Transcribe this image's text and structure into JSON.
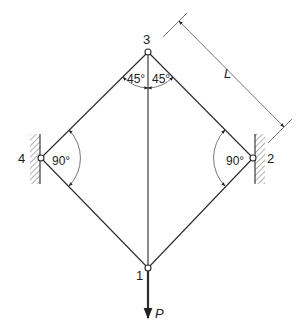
{
  "diagram": {
    "type": "truss",
    "nodes": [
      {
        "id": "1",
        "label": "1",
        "x": 148,
        "y": 268
      },
      {
        "id": "2",
        "label": "2",
        "x": 253,
        "y": 158
      },
      {
        "id": "3",
        "label": "3",
        "x": 148,
        "y": 52
      },
      {
        "id": "4",
        "label": "4",
        "x": 41,
        "y": 158
      }
    ],
    "members": [
      {
        "from": "3",
        "to": "4"
      },
      {
        "from": "3",
        "to": "2"
      },
      {
        "from": "4",
        "to": "1"
      },
      {
        "from": "2",
        "to": "1"
      },
      {
        "from": "3",
        "to": "1"
      }
    ],
    "supports": [
      {
        "node": "4",
        "type": "wall-pin",
        "side": "left"
      },
      {
        "node": "2",
        "type": "wall-pin",
        "side": "right"
      }
    ],
    "angles": [
      {
        "at": "3",
        "label": "45°",
        "side": "left"
      },
      {
        "at": "3",
        "label": "45°",
        "side": "right"
      },
      {
        "at": "4",
        "label": "90°"
      },
      {
        "at": "2",
        "label": "90°"
      }
    ],
    "load": {
      "node": "1",
      "label": "P",
      "direction": "down"
    },
    "dimension": {
      "label": "L",
      "between": [
        "3",
        "2"
      ]
    }
  }
}
